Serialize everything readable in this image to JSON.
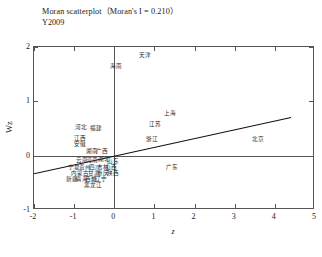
{
  "title": {
    "main": "Moran scatterplot（Moran's I = 0.210）",
    "sub": "Y2009"
  },
  "chart_data": {
    "type": "scatter",
    "title": "Moran scatterplot（Moran's I = 0.210）",
    "subtitle": "Y2009",
    "xlabel": "z",
    "ylabel": "Wz",
    "xlim": [
      -2,
      5
    ],
    "ylim": [
      -1,
      2
    ],
    "xticks": [
      -2,
      -1,
      0,
      1,
      2,
      3,
      4,
      5
    ],
    "yticks": [
      -1,
      0,
      1,
      2
    ],
    "xtick_labels": [
      "-2",
      "-1",
      "0",
      "1",
      "2",
      "3",
      "4",
      "5"
    ],
    "ytick_labels": [
      "-1",
      "0",
      "1",
      "2"
    ],
    "grid": false,
    "legend": false,
    "morans_i": 0.21,
    "reference_lines": {
      "vertical_x": 0,
      "horizontal_y": 0
    },
    "fit_line": {
      "slope": 0.163,
      "intercept": -0.0375,
      "x_start": -2.0,
      "x_end": 4.45
    },
    "points": [
      {
        "label": "天津",
        "x": 0.76,
        "y": 1.84
      },
      {
        "label": "海南",
        "x": 0.05,
        "y": 1.63
      },
      {
        "label": "上海",
        "x": 1.38,
        "y": 0.77
      },
      {
        "label": "江苏",
        "x": 1.02,
        "y": 0.57
      },
      {
        "label": "河北",
        "x": -0.84,
        "y": 0.51
      },
      {
        "label": "福建",
        "x": -0.45,
        "y": 0.49
      },
      {
        "label": "江西",
        "x": -0.85,
        "y": 0.3
      },
      {
        "label": "浙江",
        "x": 0.95,
        "y": 0.29
      },
      {
        "label": "北京",
        "x": 3.58,
        "y": 0.29
      },
      {
        "label": "安徽",
        "x": -0.85,
        "y": 0.2
      },
      {
        "label": "湖南",
        "x": -0.56,
        "y": 0.07
      },
      {
        "label": "广西",
        "x": -0.3,
        "y": 0.06
      },
      {
        "label": "云南",
        "x": -0.81,
        "y": -0.09
      },
      {
        "label": "河南",
        "x": -0.55,
        "y": -0.09
      },
      {
        "label": "湖北",
        "x": -0.25,
        "y": -0.08
      },
      {
        "label": "山东",
        "x": -0.03,
        "y": -0.11
      },
      {
        "label": "广东",
        "x": 1.45,
        "y": -0.22
      },
      {
        "label": "宁夏",
        "x": -1.01,
        "y": -0.22
      },
      {
        "label": "贵州",
        "x": -0.74,
        "y": -0.22
      },
      {
        "label": "四川",
        "x": -0.49,
        "y": -0.22
      },
      {
        "label": "吉林",
        "x": -0.28,
        "y": -0.22
      },
      {
        "label": "山西",
        "x": -0.09,
        "y": -0.22
      },
      {
        "label": "内蒙古",
        "x": -0.85,
        "y": -0.34
      },
      {
        "label": "甘肃",
        "x": -0.5,
        "y": -0.34
      },
      {
        "label": "重庆",
        "x": -0.28,
        "y": -0.34
      },
      {
        "label": "陕西",
        "x": -0.02,
        "y": -0.34
      },
      {
        "label": "新疆",
        "x": -1.05,
        "y": -0.45
      },
      {
        "label": "青海",
        "x": -0.8,
        "y": -0.45
      },
      {
        "label": "西藏",
        "x": -0.58,
        "y": -0.45
      },
      {
        "label": "辽宁",
        "x": -0.33,
        "y": -0.45
      },
      {
        "label": "黑龙江",
        "x": -0.53,
        "y": -0.56
      }
    ]
  }
}
